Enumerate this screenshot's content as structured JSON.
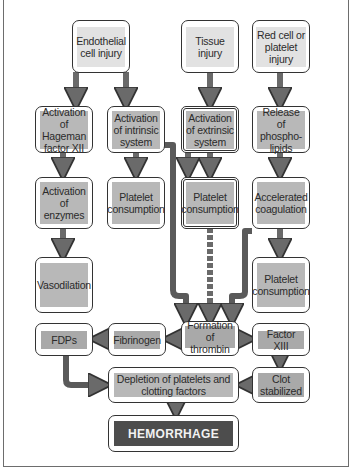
{
  "diagram": {
    "colors": {
      "start_fill": "#e2e2e2",
      "process_fill": "#b8b8b8",
      "outcome_fill": "#4d4d4d",
      "arrow": "#6a6a6a",
      "border": "#333333"
    },
    "nodes": {
      "endothelial": "Endothelial cell injury",
      "tissue": "Tissue injury",
      "redcell": "Red cell or platelet injury",
      "hageman": "Activation of Hageman factor XII",
      "intrinsic": "Activation of intrinsic system",
      "extrinsic": "Activation of extrinsic system",
      "phospholipids": "Release of phospho-lipids",
      "enzymes": "Activation of enzymes",
      "platelet_consumption_1": "Platelet consumption",
      "platelet_consumption_2": "Platelet consumption",
      "accelerated": "Accelerated coagulation",
      "vasodilation": "Vasodilation",
      "platelet_consumption_3": "Platelet consumption",
      "fdps": "FDPs",
      "fibrinogen": "Fibrinogen",
      "thrombin": "Formation of thrombin",
      "factor13": "Factor XIII",
      "depletion": "Depletion of platelets and clotting factors",
      "clot": "Clot stabilized",
      "hemorrhage": "HEMORRHAGE"
    },
    "edges": [
      [
        "endothelial",
        "hageman"
      ],
      [
        "endothelial",
        "intrinsic"
      ],
      [
        "tissue",
        "extrinsic"
      ],
      [
        "redcell",
        "phospholipids"
      ],
      [
        "hageman",
        "enzymes"
      ],
      [
        "intrinsic",
        "platelet_consumption_1"
      ],
      [
        "intrinsic",
        "thrombin"
      ],
      [
        "extrinsic",
        "platelet_consumption_2"
      ],
      [
        "platelet_consumption_2",
        "thrombin"
      ],
      [
        "phospholipids",
        "accelerated"
      ],
      [
        "accelerated",
        "thrombin"
      ],
      [
        "accelerated",
        "platelet_consumption_3"
      ],
      [
        "enzymes",
        "vasodilation"
      ],
      [
        "thrombin",
        "fibrinogen"
      ],
      [
        "fibrinogen",
        "fdps"
      ],
      [
        "thrombin",
        "factor13"
      ],
      [
        "fdps",
        "depletion"
      ],
      [
        "factor13",
        "clot"
      ],
      [
        "clot",
        "depletion"
      ],
      [
        "depletion",
        "hemorrhage"
      ]
    ]
  }
}
